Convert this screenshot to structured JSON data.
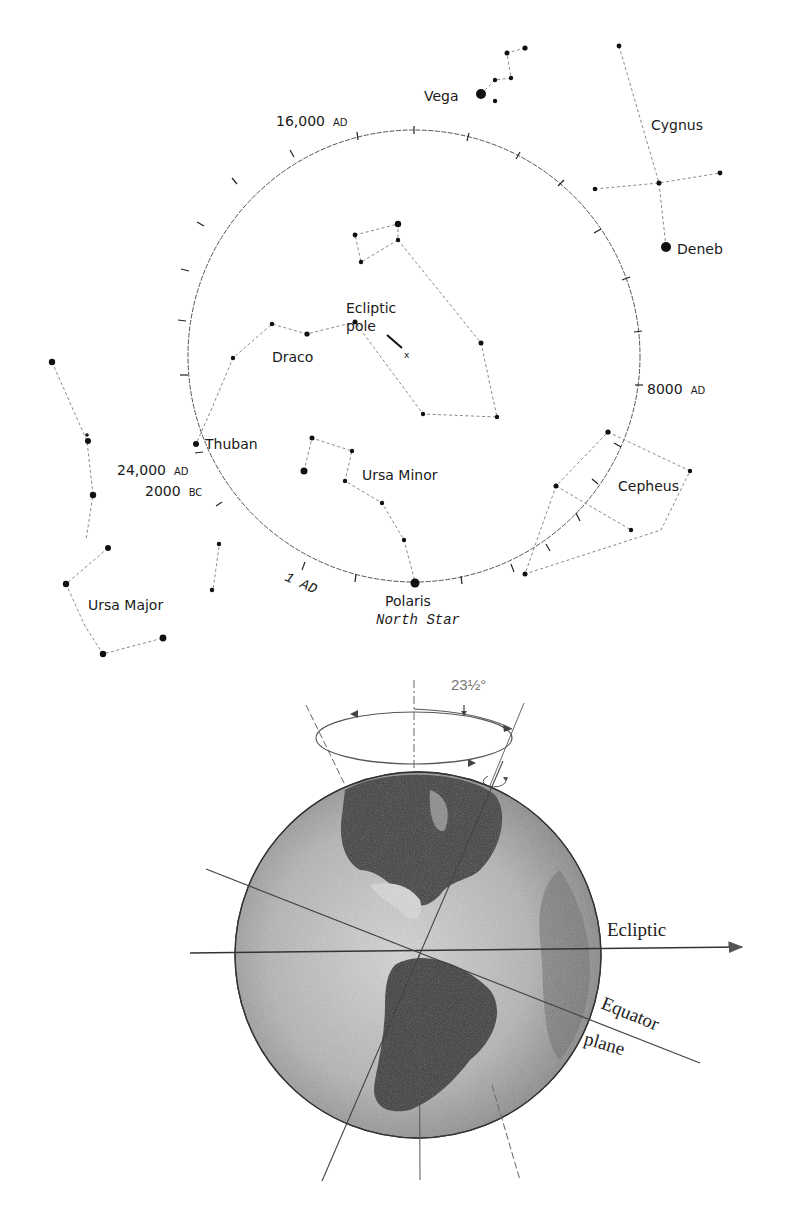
{
  "figure": {
    "top_panel": {
      "title": "Precession path of the north celestial pole",
      "circle_labels": {
        "ad16000": {
          "num": "16,000",
          "era": "AD"
        },
        "ad8000": {
          "num": "8000",
          "era": "AD"
        },
        "ad24000": {
          "num": "24,000",
          "era": "AD"
        },
        "bc2000": {
          "num": "2000",
          "era": "BC"
        },
        "ad1": "1 AD"
      },
      "ecliptic_pole": {
        "line1": "Ecliptic",
        "line2": "pole",
        "marker": "x"
      },
      "stars": {
        "vega": "Vega",
        "deneb": "Deneb",
        "thuban": "Thuban",
        "polaris": "Polaris",
        "polaris_sub": "North Star"
      },
      "constellations": {
        "cygnus": "Cygnus",
        "draco": "Draco",
        "ursa_minor": "Ursa Minor",
        "ursa_major": "Ursa Major",
        "cepheus": "Cepheus"
      }
    },
    "bottom_panel": {
      "tilt_angle": "23½°",
      "ecliptic_label": "Ecliptic",
      "equator_label_1": "Equator",
      "equator_label_2": "plane"
    },
    "colors": {
      "ink": "#1a1a1a",
      "dotted_line": "#8a8a8a",
      "globe_light": "#c8c8c8",
      "globe_dark": "#3a3a3a"
    }
  }
}
